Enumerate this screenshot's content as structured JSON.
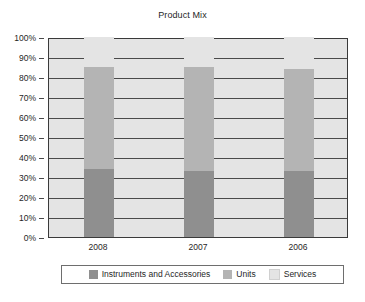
{
  "chart_data": {
    "type": "bar",
    "subtype": "stacked-percentage-column",
    "title": "Product Mix",
    "xlabel": "",
    "ylabel": "",
    "categories": [
      "2008",
      "2007",
      "2006"
    ],
    "series": [
      {
        "name": "Instruments and Accessories",
        "color": "#8f8f8f",
        "values": [
          34,
          33,
          33
        ]
      },
      {
        "name": "Units",
        "color": "#b4b4b4",
        "values": [
          51,
          52,
          51
        ]
      },
      {
        "name": "Services",
        "color": "#e4e4e4",
        "values": [
          15,
          15,
          16
        ]
      }
    ],
    "ylim": [
      0,
      100
    ],
    "ytick_values": [
      0,
      10,
      20,
      30,
      40,
      50,
      60,
      70,
      80,
      90,
      100
    ],
    "ytick_labels": [
      "0%",
      "10%",
      "20%",
      "30%",
      "40%",
      "50%",
      "60%",
      "70%",
      "80%",
      "90%",
      "100%"
    ],
    "grid": true,
    "grid_axis": "y",
    "legend_position": "bottom",
    "stack_tops": {
      "2008": {
        "instruments": 34,
        "units": 85,
        "services": 100
      },
      "2007": {
        "instruments": 33,
        "units": 85,
        "services": 100
      },
      "2006": {
        "instruments": 33,
        "units": 84,
        "services": 100
      }
    }
  },
  "colors": {
    "plot_background": "#e4e4e4",
    "frame": "#3a3a3a",
    "gridline": "#4a4a4a",
    "instruments": "#8f8f8f",
    "units": "#b4b4b4",
    "services": "#e4e4e4",
    "legend_border": "#6e6e6e",
    "text": "#1f1f1f",
    "page_background": "#ffffff"
  }
}
